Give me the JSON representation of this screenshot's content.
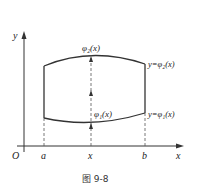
{
  "figure": {
    "caption": "图 9-8",
    "axes": {
      "x_label": "x",
      "y_label": "y",
      "origin_label": "O"
    },
    "ticks": {
      "a": "a",
      "x": "x",
      "b": "b"
    },
    "curves": {
      "upper_label_top": "φ₂(x)",
      "upper_label_right": "y=φ₂(x)",
      "lower_label_mid": "φ₁(x)",
      "lower_label_right": "y=φ₁(x)"
    },
    "colors": {
      "stroke": "#333333",
      "text": "#222222",
      "background": "#ffffff"
    }
  }
}
